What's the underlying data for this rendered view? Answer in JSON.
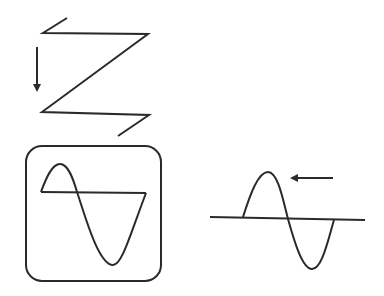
{
  "diagram": {
    "colors": {
      "stroke": "#2a2a2a",
      "background": "#ffffff"
    },
    "parts": [
      {
        "id": "raster-scan",
        "label": "zigzag scan path with downward arrow"
      },
      {
        "id": "display-waveform",
        "label": "sine cycle with retrace inside rounded screen"
      },
      {
        "id": "traveling-wave",
        "label": "sine cycle on baseline with leftward arrow"
      }
    ]
  }
}
